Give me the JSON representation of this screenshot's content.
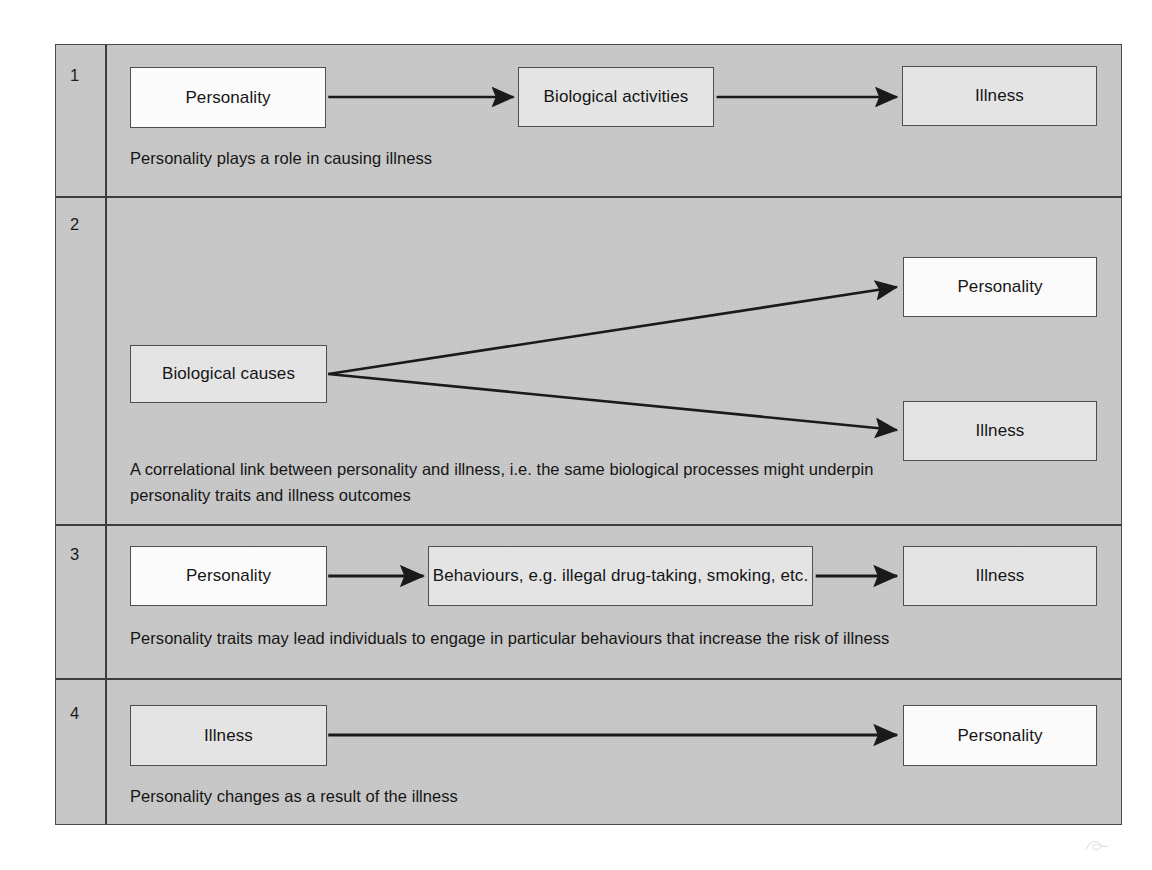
{
  "figure": {
    "background_color": "#c9c9c9",
    "frame_border_color": "#4a4a4a",
    "arrow_color": "#1a1a1a",
    "rows": [
      {
        "number": "1",
        "caption": "Personality plays a role in causing illness",
        "nodes": [
          {
            "label": "Personality",
            "style": "white"
          },
          {
            "label": "Biological activities",
            "style": "shaded"
          },
          {
            "label": "Illness",
            "style": "shaded"
          }
        ]
      },
      {
        "number": "2",
        "caption_line_1": "A correlational link between personality and illness, i.e. the same biological processes might underpin",
        "caption_line_2": "personality traits and illness outcomes",
        "nodes": [
          {
            "label": "Biological causes",
            "style": "shaded"
          },
          {
            "label": "Personality",
            "style": "white"
          },
          {
            "label": "Illness",
            "style": "shaded"
          }
        ]
      },
      {
        "number": "3",
        "caption": "Personality traits may lead individuals to engage in particular behaviours that increase the risk of illness",
        "nodes": [
          {
            "label": "Personality",
            "style": "white"
          },
          {
            "label": "Behaviours, e.g. illegal drug-taking, smoking, etc.",
            "style": "shaded"
          },
          {
            "label": "Illness",
            "style": "shaded"
          }
        ]
      },
      {
        "number": "4",
        "caption": "Personality changes as a result of the illness",
        "nodes": [
          {
            "label": "Illness",
            "style": "shaded"
          },
          {
            "label": "Personality",
            "style": "white"
          }
        ]
      }
    ]
  }
}
